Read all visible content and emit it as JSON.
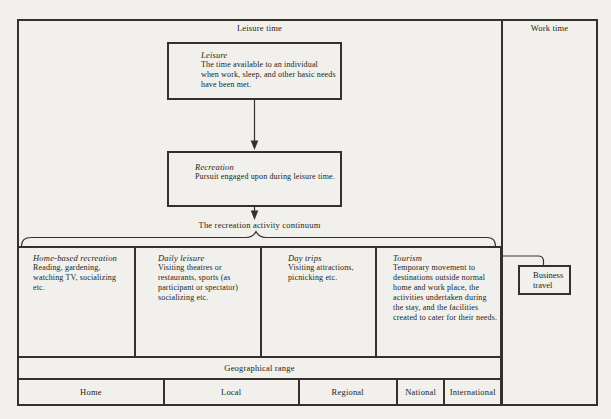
{
  "header": {
    "leisure_time": "Leisure time",
    "work_time": "Work time"
  },
  "leisure_box": {
    "title": "Leisure",
    "body": "The time available to an individual when work, sleep, and other basic needs have been met."
  },
  "recreation_box": {
    "title": "Recreation",
    "body": "Pursuit engaged upon during leisure time."
  },
  "continuum": {
    "label": "The recreation activity continuum"
  },
  "columns": [
    {
      "title": "Home-based recreation",
      "body": "Reading, gardening, watching TV, socializing etc."
    },
    {
      "title": "Daily leisure",
      "body": "Visiting theatres or restaurants, sports (as participant or spectator) socializing etc."
    },
    {
      "title": "Day trips",
      "body": "Visiting attractions, picnicking etc."
    },
    {
      "title": "Tourism",
      "body": "Temporary movement to destinations outside normal home and work place, the activities undertaken during the stay, and the facilities created to cater for their needs."
    }
  ],
  "business": {
    "label": "Business travel"
  },
  "geo": {
    "label": "Geographical range",
    "levels": [
      "Home",
      "Local",
      "Regional",
      "National",
      "International"
    ]
  },
  "colors": {
    "paper": "#f1f0ec",
    "line": "#34312a",
    "text": "#211f1a"
  }
}
